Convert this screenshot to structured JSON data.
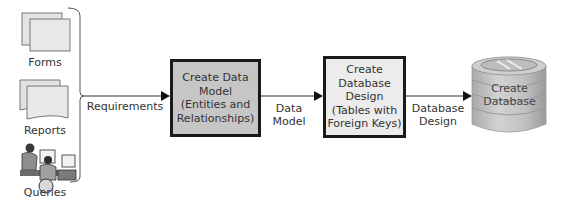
{
  "inputs": [
    {
      "label": "Forms",
      "icon": "forms-document-icon"
    },
    {
      "label": "Reports",
      "icon": "reports-document-icon"
    },
    {
      "label": "Queries",
      "icon": "people-at-computers-icon"
    }
  ],
  "flows": {
    "requirements": "Requirements",
    "data_model": "Data\nModel",
    "database_design": "Database\nDesign"
  },
  "steps": [
    {
      "label": "Create Data\nModel\n(Entities and\nRelationships)",
      "fill": "#c6c6c6"
    },
    {
      "label": "Create\nDatabase\nDesign\n(Tables with\nForeign Keys)",
      "fill": "#ececec"
    }
  ],
  "output": {
    "label": "Create\nDatabase",
    "icon": "database-cylinder-icon",
    "fill": "#bdbdbd"
  },
  "colors": {
    "border": "#1a1a1a",
    "line": "#333333",
    "text": "#333333"
  }
}
